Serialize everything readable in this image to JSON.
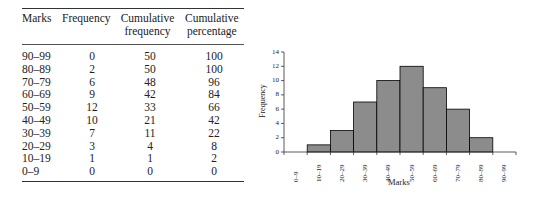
{
  "table": {
    "headers": [
      {
        "line1": "Marks",
        "line2": ""
      },
      {
        "line1": "Frequency",
        "line2": ""
      },
      {
        "line1": "Cumulative",
        "line2": "frequency"
      },
      {
        "line1": "Cumulative",
        "line2": "percentage"
      }
    ],
    "rows": [
      [
        "90–99",
        "0",
        "50",
        "100"
      ],
      [
        "80–89",
        "2",
        "50",
        "100"
      ],
      [
        "70–79",
        "6",
        "48",
        "96"
      ],
      [
        "60–69",
        "9",
        "42",
        "84"
      ],
      [
        "50–59",
        "12",
        "33",
        "66"
      ],
      [
        "40–49",
        "10",
        "21",
        "42"
      ],
      [
        "30–39",
        "7",
        "11",
        "22"
      ],
      [
        "20–29",
        "3",
        "4",
        "8"
      ],
      [
        "10–19",
        "1",
        "1",
        "2"
      ],
      [
        "0–9",
        "0",
        "0",
        "0"
      ]
    ]
  },
  "chart_data": {
    "type": "bar",
    "title": "",
    "categories": [
      "0–9",
      "10–19",
      "20–29",
      "30–39",
      "40–49",
      "50–59",
      "60–69",
      "70–79",
      "80–89",
      "90–99"
    ],
    "values": [
      0,
      1,
      3,
      7,
      10,
      12,
      9,
      6,
      2,
      0
    ],
    "xlabel": "Marks",
    "ylabel": "Frequency",
    "ylim": [
      0,
      14
    ],
    "yticks": [
      "0",
      "2",
      "4",
      "6",
      "8",
      "10",
      "12",
      "14"
    ],
    "grid": false,
    "legend": null,
    "bar_color": "#8c8c8c",
    "bar_edge_color": "#000000",
    "histogram": true
  }
}
